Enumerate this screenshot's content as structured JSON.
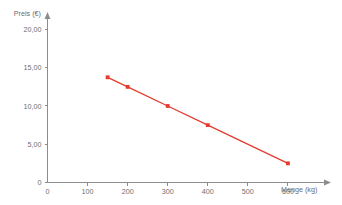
{
  "chart_data": {
    "type": "line",
    "title": "",
    "subtitle": "",
    "xlabel": "Menge (kg)",
    "ylabel": "Preis (€)",
    "xlim": [
      0,
      680
    ],
    "ylim": [
      0,
      21.5
    ],
    "grid": false,
    "legend": null,
    "x_ticks": [
      0,
      100,
      200,
      300,
      400,
      500,
      600
    ],
    "x_tick_labels": [
      "0",
      "100",
      "200",
      "300",
      "400",
      "500",
      "600"
    ],
    "y_ticks": [
      0,
      5,
      10,
      15,
      20
    ],
    "y_tick_labels": [
      "0",
      "5,00",
      "10,00",
      "15,00",
      "20,00"
    ],
    "series": [
      {
        "name": "Preis",
        "color": "#e43b2e",
        "marker": "square",
        "x": [
          150,
          200,
          300,
          400,
          600
        ],
        "values": [
          13.75,
          12.5,
          10.0,
          7.5,
          2.5
        ],
        "points": [
          {
            "x": 150,
            "y": 13.75
          },
          {
            "x": 200,
            "y": 12.5
          },
          {
            "x": 300,
            "y": 10.0
          },
          {
            "x": 400,
            "y": 7.5
          },
          {
            "x": 600,
            "y": 2.5
          }
        ]
      }
    ],
    "annotations": [],
    "colors": {
      "series_red": "#e43b2e",
      "axis_gray": "#8c8c8c",
      "text_gray": "#6e6e6e",
      "background": "#ffffff"
    }
  }
}
